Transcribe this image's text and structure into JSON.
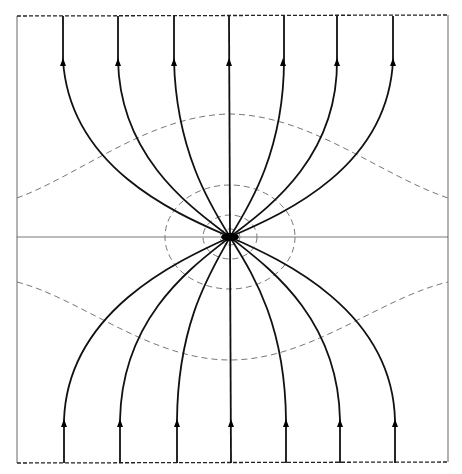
{
  "diagram": {
    "type": "field-line diagram",
    "box": {
      "left": 17,
      "right": 448,
      "top": 16,
      "bottom": 463
    },
    "center": {
      "x": 230,
      "y": 237
    },
    "top_lines_x": [
      63,
      118,
      174,
      229,
      283,
      337,
      393
    ],
    "bottom_lines_x": [
      64,
      120,
      177,
      231,
      286,
      340,
      395
    ],
    "arrow_direction": "upward",
    "colors": {
      "field_line": "#111111",
      "equipotential": "#777777",
      "border": "#555555"
    }
  }
}
